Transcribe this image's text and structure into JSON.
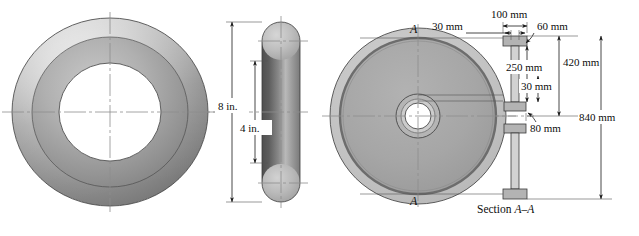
{
  "figure": {
    "background_color": "#ffffff",
    "line_color": "#1a1a1a",
    "centerline_color": "#8e8e8e"
  },
  "left_figure": {
    "name": "torus-ring",
    "front_view": {
      "label": "torus-front-view",
      "shading": {
        "outer_highlight": "#d8d8d8",
        "outer_shadow": "#6f6f6f",
        "mid_tone": "#a9a9a9",
        "inner_shadow": "#838383"
      }
    },
    "side_view": {
      "label": "torus-side-section",
      "shading": {
        "circle_fill": "#b4b4b4",
        "band_dark": "#5a5a5a",
        "band_light": "#c9c9c9"
      }
    },
    "dimensions": [
      {
        "id": "outer-diameter",
        "value": "8 in."
      },
      {
        "id": "inner-diameter",
        "value": "4 in."
      }
    ]
  },
  "right_figure": {
    "name": "flywheel",
    "front_view": {
      "label": "flywheel-front-view",
      "section_marker_top": "A",
      "section_marker_bottom": "A",
      "shading": {
        "rim_outer": "#c0c0c0",
        "rim_band": "#7d7d7d",
        "web_fill": "#a6a6a6",
        "hub_ring": "#b8b8b8",
        "bore_fill": "#ffffff"
      }
    },
    "section_view": {
      "label": "flywheel-section-view",
      "caption_prefix": "Section ",
      "caption_letters": "A–A",
      "shading": {
        "flange_fill": "#b3b3b3",
        "web_fill": "#cfcfcf"
      }
    },
    "dimensions": [
      {
        "id": "rim-width-total",
        "value": "100 mm"
      },
      {
        "id": "web-thickness",
        "value": "30 mm"
      },
      {
        "id": "flange-thickness",
        "value": "60 mm"
      },
      {
        "id": "inner-radius-to-web",
        "value": "250 mm"
      },
      {
        "id": "hub-flange-thickness",
        "value": "30 mm"
      },
      {
        "id": "hub-width",
        "value": "80 mm"
      },
      {
        "id": "mid-diameter",
        "value": "420 mm"
      },
      {
        "id": "outer-diameter",
        "value": "840 mm"
      }
    ]
  }
}
